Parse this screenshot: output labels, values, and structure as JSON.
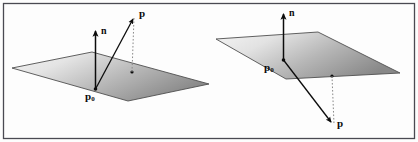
{
  "figure": {
    "caption": "",
    "background_color": "#fdfdfd",
    "border_color": "#4a4a52",
    "ink_color": "#0c0c0c",
    "plane_fill_light": "#efefef",
    "plane_fill_dark": "#8f8f8f",
    "plane_edge_color": "#4f4f4f"
  },
  "diagrams": [
    {
      "id": "left-diagram",
      "name": "point-above-plane",
      "labels": {
        "normal": "n",
        "base_point": "p",
        "base_point_subscript": "0",
        "point": "p"
      }
    },
    {
      "id": "right-diagram",
      "name": "point-below-plane",
      "labels": {
        "normal": "n",
        "base_point": "p",
        "base_point_subscript": "0",
        "point": "p"
      }
    }
  ]
}
